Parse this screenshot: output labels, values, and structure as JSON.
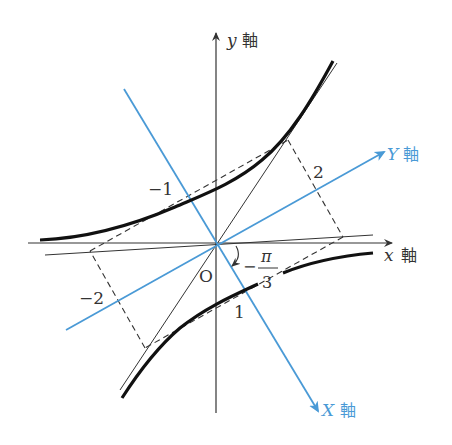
{
  "figure": {
    "type": "rotated-hyperbola-diagram",
    "colors": {
      "original_axes": "#333333",
      "rotated_axes": "#4a9ad6",
      "curve": "#111111",
      "asymptote": "#333333",
      "dashed": "#333333"
    },
    "axes": {
      "x": {
        "var": "x",
        "suffix": "軸"
      },
      "y": {
        "var": "y",
        "suffix": "軸"
      },
      "X": {
        "var": "X",
        "suffix": "軸"
      },
      "Y": {
        "var": "Y",
        "suffix": "軸"
      }
    },
    "origin_label": "O",
    "angle_label": {
      "sign": "−",
      "numerator": "π",
      "denominator": "3"
    },
    "tick_labels": {
      "neg_one": "−1",
      "two": "2",
      "neg_two": "−2",
      "one": "1"
    }
  }
}
